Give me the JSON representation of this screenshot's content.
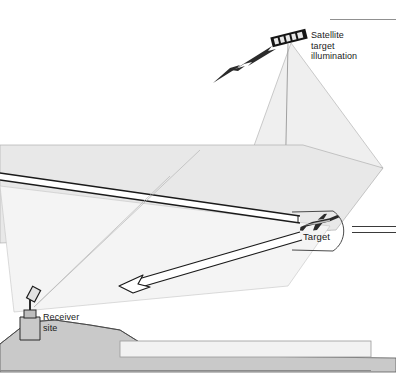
{
  "diagram": {
    "labels": {
      "satellite": "Satellite\ntarget\nillumination",
      "target": "Target",
      "receiver": "Receiver\nsite"
    },
    "icons": {
      "satellite": "satellite-icon",
      "aircraft": "aircraft-target-icon",
      "antenna": "receiver-antenna-icon",
      "bolt": "lightning-bolt-icon",
      "arrow": "beam-arrowhead-icon"
    },
    "colors": {
      "ground": "#c9c9c9",
      "plane_fill": "#e8e8e8",
      "cone_fill": "#efefef",
      "band_fill": "#f2f2f2",
      "line": "#1a1a1a",
      "thin_line": "#8c8c8c",
      "text": "#1a1a1a",
      "background": "#ffffff"
    },
    "elements": [
      "satellite-icon",
      "illumination-cone",
      "lightning-bolt-icon",
      "upper-beam-tube",
      "lower-beam-tube",
      "beam-arrowhead-icon",
      "target-illumination-oval",
      "aircraft-target-icon",
      "receiver-antenna-icon",
      "ground-terrain",
      "ground-band",
      "top-rule",
      "bottom-rule"
    ]
  }
}
